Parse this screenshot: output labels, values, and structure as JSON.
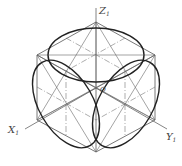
{
  "diagram": {
    "axes": {
      "z": {
        "label": "Z",
        "subscript": "1"
      },
      "x": {
        "label": "X",
        "subscript": "1"
      },
      "y": {
        "label": "Y",
        "subscript": "1"
      }
    },
    "origin_label": "O",
    "colors": {
      "line": "#555555",
      "ellipse": "#222222",
      "background": "#ffffff"
    }
  }
}
